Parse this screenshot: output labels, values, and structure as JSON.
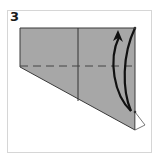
{
  "diagram": {
    "step_number": "3",
    "colors": {
      "paper_fill": "#a7a7a7",
      "outline": "#3a3a3a",
      "arrow": "#111111",
      "flap_fill": "#ffffff",
      "frame_border": "#d6d6d6"
    },
    "elements": {
      "paper": "folded paper shape (trapezoid)",
      "crease": "vertical crease line",
      "fold_line": "horizontal dashed valley-fold line",
      "flap": "small white triangular flap at bottom-right corner",
      "arrow": "curved fold arrow pointing upward"
    }
  }
}
